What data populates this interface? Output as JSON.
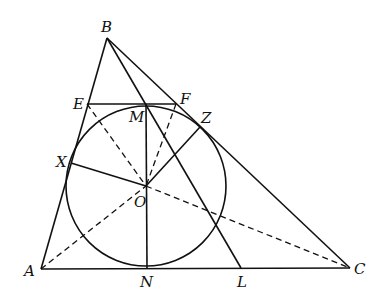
{
  "diagram": {
    "type": "geometry",
    "labels": {
      "A": "A",
      "B": "B",
      "C": "C",
      "E": "E",
      "F": "F",
      "M": "M",
      "Z": "Z",
      "X": "X",
      "O": "O",
      "N": "N",
      "L": "L"
    },
    "points": {
      "A": [
        41,
        269
      ],
      "B": [
        107,
        38
      ],
      "C": [
        350,
        268
      ],
      "E": [
        87,
        104
      ],
      "F": [
        176,
        104
      ],
      "M": [
        146,
        104
      ],
      "Z": [
        200,
        127
      ],
      "X": [
        71,
        163
      ],
      "O": [
        146,
        186
      ],
      "N": [
        147,
        268
      ],
      "L": [
        241,
        268
      ]
    },
    "circle": {
      "center": "O",
      "radius": 80
    },
    "colors": {
      "stroke": "#111111",
      "background": "#ffffff"
    }
  }
}
